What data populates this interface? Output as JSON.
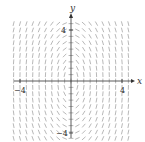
{
  "chart_data": {
    "type": "slope-field",
    "title": "",
    "xlabel": "x",
    "ylabel": "y",
    "xlim": [
      -4.8,
      4.8
    ],
    "ylim": [
      -4.8,
      4.8
    ],
    "x_ticks": [
      -4,
      4
    ],
    "y_ticks": [
      -4,
      4
    ],
    "tick_labels": {
      "x_left": "−4",
      "x_right": "4",
      "y_top": "4",
      "y_bottom": "−4"
    },
    "grid": false,
    "equation_hint": "dy/dx = -4x/y",
    "grid_points": {
      "nx": 19,
      "ny": 19
    }
  }
}
